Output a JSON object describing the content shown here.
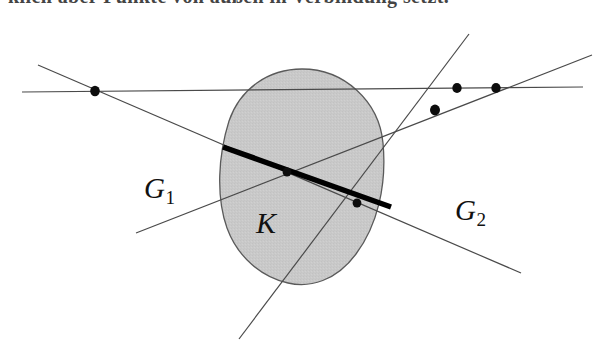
{
  "figure": {
    "title_fragment": "klich aber Punkte von außen in Verbindung setzt.",
    "caption": "",
    "background_color": "#ffffff",
    "region": {
      "name": "K",
      "label": "K",
      "fill_color": "#c9c9c9",
      "stroke_color": "#555555",
      "description": "shaded convex oval region"
    },
    "labels": [
      {
        "id": "g1",
        "base": "G",
        "subscript": "1",
        "color": "#111111"
      },
      {
        "id": "g2",
        "base": "G",
        "subscript": "2",
        "color": "#111111"
      },
      {
        "id": "k",
        "base": "K",
        "subscript": "",
        "color": "#111111"
      }
    ],
    "lines": [
      {
        "name": "horizontal-line",
        "x1": 22,
        "y1": 92,
        "x2": 583,
        "y2": 87,
        "stroke": "#4a4a4a",
        "width": 1.2
      },
      {
        "name": "line-g1",
        "x1": 38,
        "y1": 65,
        "x2": 521,
        "y2": 273,
        "stroke": "#4a4a4a",
        "width": 1.2
      },
      {
        "name": "line-g2",
        "x1": 136,
        "y1": 233,
        "x2": 592,
        "y2": 55,
        "stroke": "#4a4a4a",
        "width": 1.2
      },
      {
        "name": "line-secant-steep",
        "x1": 239,
        "y1": 339,
        "x2": 469,
        "y2": 34,
        "stroke": "#4a4a4a",
        "width": 1.2
      }
    ],
    "chord": {
      "name": "thick-chord",
      "x1": 223,
      "y1": 147,
      "x2": 391,
      "y2": 207,
      "stroke": "#000000",
      "width": 5.5
    },
    "points": [
      {
        "name": "point-left-on-horizontal",
        "x": 95,
        "y": 91,
        "r": 4.6
      },
      {
        "name": "point-chord-center-crossing",
        "x": 287,
        "y": 172,
        "r": 4.4
      },
      {
        "name": "point-chord-right-crossing",
        "x": 357,
        "y": 203,
        "r": 4.4
      },
      {
        "name": "point-lower-right-crossing",
        "x": 435,
        "y": 110,
        "r": 5.0
      },
      {
        "name": "point-right-inner-on-horizontal",
        "x": 457,
        "y": 88,
        "r": 4.6
      },
      {
        "name": "point-right-outer-on-horizontal",
        "x": 496,
        "y": 88,
        "r": 4.6
      }
    ],
    "oval": {
      "cx": 302,
      "cy": 176,
      "rx": 80,
      "ry": 107,
      "rotation": -4
    }
  }
}
